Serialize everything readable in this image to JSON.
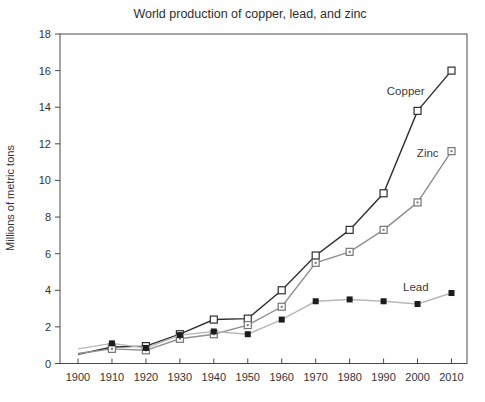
{
  "title": "World production of copper, lead, and zinc",
  "chart_data": {
    "type": "line",
    "title": "World production of copper, lead, and zinc",
    "xlabel": "",
    "ylabel": "Millions of metric tons",
    "xlim": [
      1900,
      2010
    ],
    "ylim": [
      0,
      18
    ],
    "grid": false,
    "legend_position": "inline-labels",
    "x": [
      1900,
      1910,
      1920,
      1930,
      1940,
      1950,
      1960,
      1970,
      1980,
      1990,
      2000,
      2010
    ],
    "xticks": [
      1900,
      1910,
      1920,
      1930,
      1940,
      1950,
      1960,
      1970,
      1980,
      1990,
      2000,
      2010
    ],
    "yticks": [
      0,
      2,
      4,
      6,
      8,
      10,
      12,
      14,
      16,
      18
    ],
    "series": [
      {
        "name": "Copper",
        "values": [
          0.5,
          0.9,
          0.95,
          1.6,
          2.4,
          2.45,
          4.0,
          5.9,
          7.3,
          9.3,
          13.8,
          16.0
        ],
        "line_color": "#2f2f2f",
        "marker": "open-square",
        "marker_color": "#2f2f2f",
        "label": {
          "x": 1996.5,
          "y": 14.9
        }
      },
      {
        "name": "Zinc",
        "values": [
          0.55,
          0.8,
          0.72,
          1.35,
          1.6,
          2.1,
          3.1,
          5.5,
          6.1,
          7.3,
          8.8,
          11.6
        ],
        "line_color": "#909090",
        "marker": "square-dot",
        "marker_color": "#757575",
        "label": {
          "x": 2003,
          "y": 11.5
        }
      },
      {
        "name": "Lead",
        "values": [
          0.8,
          1.1,
          0.85,
          1.55,
          1.75,
          1.6,
          2.4,
          3.4,
          3.5,
          3.4,
          3.25,
          3.85
        ],
        "line_color": "#b8b8b8",
        "marker": "filled-square",
        "marker_color": "#1c1c1c",
        "label": {
          "x": 1999.5,
          "y": 4.2
        }
      }
    ]
  }
}
